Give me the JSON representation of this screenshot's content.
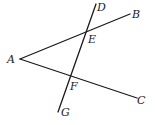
{
  "diagram": {
    "type": "geometry",
    "points": {
      "A": {
        "label": "A",
        "x": 20,
        "y": 59
      },
      "B": {
        "label": "B",
        "x": 130,
        "y": 14
      },
      "C": {
        "label": "C",
        "x": 137,
        "y": 98
      },
      "D": {
        "label": "D",
        "x": 96,
        "y": 4
      },
      "E": {
        "label": "E",
        "x": 87,
        "y": 31
      },
      "F": {
        "label": "F",
        "x": 71,
        "y": 77
      },
      "G": {
        "label": "G",
        "x": 58,
        "y": 111
      }
    },
    "segments": [
      {
        "from": "A",
        "to": "B"
      },
      {
        "from": "A",
        "to": "C"
      },
      {
        "from": "D",
        "to": "G"
      }
    ],
    "labels": {
      "A": "A",
      "B": "B",
      "C": "C",
      "D": "D",
      "E": "E",
      "F": "F",
      "G": "G"
    },
    "stroke_color": "#1a1a1a",
    "background": "#ffffff"
  }
}
